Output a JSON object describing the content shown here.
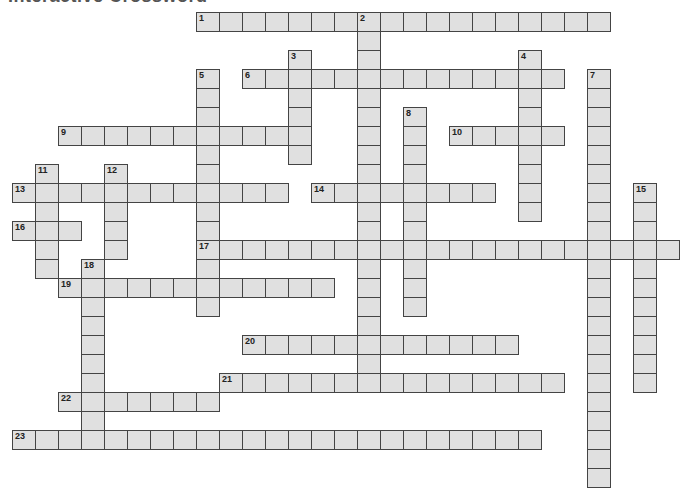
{
  "title": "Interactive Crossword",
  "grid": {
    "origin_x": 12,
    "origin_y": 12,
    "cell_width": 23,
    "cell_height": 19,
    "cell_fill": "#e0e0e0",
    "cell_border": "#444444"
  },
  "across": [
    {
      "number": 1,
      "row": 0,
      "col": 8,
      "length": 18
    },
    {
      "number": 6,
      "row": 3,
      "col": 10,
      "length": 14
    },
    {
      "number": 9,
      "row": 6,
      "col": 2,
      "length": 11
    },
    {
      "number": 10,
      "row": 6,
      "col": 19,
      "length": 5
    },
    {
      "number": 13,
      "row": 9,
      "col": 0,
      "length": 12
    },
    {
      "number": 14,
      "row": 9,
      "col": 13,
      "length": 8
    },
    {
      "number": 16,
      "row": 11,
      "col": 0,
      "length": 3
    },
    {
      "number": 17,
      "row": 12,
      "col": 8,
      "length": 21
    },
    {
      "number": 19,
      "row": 14,
      "col": 2,
      "length": 12
    },
    {
      "number": 20,
      "row": 17,
      "col": 10,
      "length": 12
    },
    {
      "number": 21,
      "row": 19,
      "col": 9,
      "length": 15
    },
    {
      "number": 22,
      "row": 20,
      "col": 2,
      "length": 7
    },
    {
      "number": 23,
      "row": 22,
      "col": 0,
      "length": 23
    }
  ],
  "down": [
    {
      "number": 2,
      "row": 0,
      "col": 15,
      "length": 20
    },
    {
      "number": 3,
      "row": 2,
      "col": 12,
      "length": 6
    },
    {
      "number": 4,
      "row": 2,
      "col": 22,
      "length": 9
    },
    {
      "number": 5,
      "row": 3,
      "col": 8,
      "length": 13
    },
    {
      "number": 7,
      "row": 3,
      "col": 25,
      "length": 22
    },
    {
      "number": 8,
      "row": 5,
      "col": 17,
      "length": 11
    },
    {
      "number": 11,
      "row": 8,
      "col": 1,
      "length": 6
    },
    {
      "number": 12,
      "row": 8,
      "col": 4,
      "length": 5
    },
    {
      "number": 15,
      "row": 9,
      "col": 27,
      "length": 11
    },
    {
      "number": 18,
      "row": 13,
      "col": 3,
      "length": 10
    }
  ]
}
